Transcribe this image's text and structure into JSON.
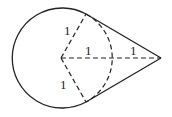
{
  "diagram": {
    "stroke_color": "#222222",
    "background": "#ffffff",
    "circle": {
      "cx": 61,
      "cy": 58,
      "r": 50
    },
    "external_point": {
      "x": 161,
      "y": 58
    },
    "tangent_points": [
      {
        "x": 86,
        "y": 14
      },
      {
        "x": 86,
        "y": 102
      }
    ],
    "labels": {
      "radius_upper": "1",
      "radius_horizontal": "1",
      "outer_segment": "1",
      "radius_lower": "1"
    }
  }
}
